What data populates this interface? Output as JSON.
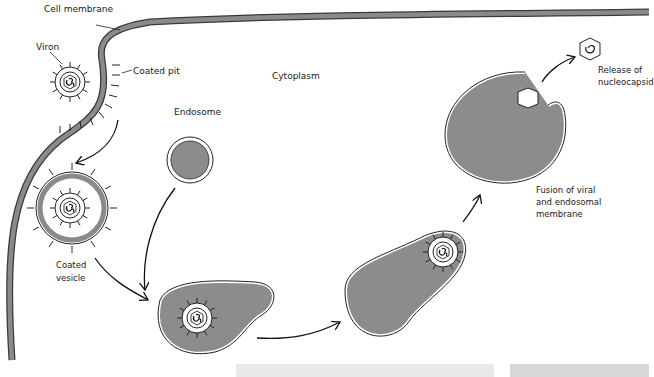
{
  "diagram": {
    "labels": {
      "cell_membrane": "Cell membrane",
      "viron": "Viron",
      "coated_pit": "Coated pit",
      "cytoplasm": "Cytoplasm",
      "endosome": "Endosome",
      "coated_vesicle_1": "Coated",
      "coated_vesicle_2": "vesicle",
      "release_1": "Release of",
      "release_2": "nucleocapsid",
      "fusion_1": "Fusion of viral",
      "fusion_2": "and endosomal membrane"
    },
    "colors": {
      "membrane_fill": "#8a8a8a",
      "membrane_stroke": "#2a2a2a",
      "lumen_fill": "#8c8c8c",
      "line": "#1a1a1a",
      "background": "#ffffff"
    },
    "steps": [
      "Coated pit",
      "Coated vesicle",
      "Endosome fusion",
      "Acidified endosome",
      "Fusion of viral and endosomal membrane",
      "Release of nucleocapsid"
    ]
  }
}
